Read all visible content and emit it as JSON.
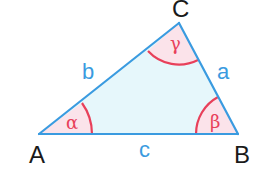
{
  "diagram": {
    "type": "triangle",
    "colors": {
      "side": "#3a9be0",
      "fill": "#e6f7fb",
      "angle_arc": "#e8405a",
      "angle_fill": "#fbe3ea",
      "vertex_text": "#1a1a1a",
      "side_text": "#3a9be0",
      "angle_text": "#e8405a"
    },
    "vertices": [
      {
        "name": "A",
        "label": "A"
      },
      {
        "name": "B",
        "label": "B"
      },
      {
        "name": "C",
        "label": "C"
      }
    ],
    "sides": [
      {
        "name": "a",
        "label": "a",
        "between": "B-C"
      },
      {
        "name": "b",
        "label": "b",
        "between": "A-C"
      },
      {
        "name": "c",
        "label": "c",
        "between": "A-B"
      }
    ],
    "angles": [
      {
        "name": "alpha",
        "label": "α",
        "vertex": "A"
      },
      {
        "name": "beta",
        "label": "β",
        "vertex": "B"
      },
      {
        "name": "gamma",
        "label": "γ",
        "vertex": "C"
      }
    ]
  }
}
